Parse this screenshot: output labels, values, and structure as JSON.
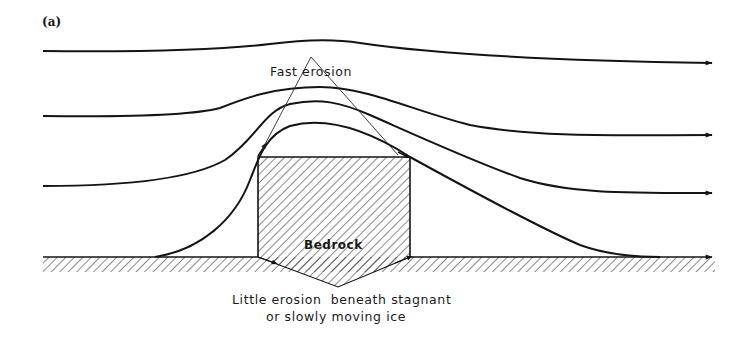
{
  "figure": {
    "panel_label": "(a)",
    "labels": {
      "fast_erosion": "Fast erosion",
      "bedrock": "Bedrock",
      "little_erosion_line1": "Little erosion  beneath stagnant",
      "little_erosion_line2": "or slowly moving ice"
    },
    "elements": {
      "flow_lines": [
        {
          "name": "flowline-1",
          "description": "uppermost ice flow line, slight rise over obstacle"
        },
        {
          "name": "flowline-2",
          "description": "second flow line, rises over obstacle"
        },
        {
          "name": "flowline-3",
          "description": "third flow line, arches over bedrock"
        },
        {
          "name": "flowline-4",
          "description": "basal flow line, drapes over bedrock knob"
        }
      ],
      "obstacle": "bedrock knob (hatched)",
      "ground": "hatched bedrock base",
      "flow_direction": "left to right"
    },
    "colors": {
      "ink": "#141414",
      "background": "#ffffff"
    }
  }
}
